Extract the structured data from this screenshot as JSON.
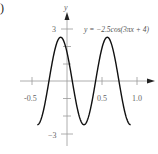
{
  "panel_label": ")",
  "chart_data": {
    "type": "line",
    "title": "",
    "equation": "y = −2.5cos(3πx + 4)",
    "xlabel": "",
    "ylabel": "y",
    "x_ticks": [
      -0.5,
      0.5,
      1.0
    ],
    "x_tick_labels": [
      "-0.5",
      "0.5",
      "1.0"
    ],
    "y_ticks": [
      3,
      -3
    ],
    "y_tick_labels": [
      "3",
      "−3"
    ],
    "xlim": [
      -0.5,
      1.1
    ],
    "ylim": [
      -3.5,
      4
    ],
    "amplitude": 2.5,
    "series": [
      {
        "name": "y = -2.5cos(3πx + 4)",
        "x_range": [
          -0.424,
          0.909
        ],
        "key_points": [
          {
            "x": -0.424,
            "y": -2.5
          },
          {
            "x": -0.091,
            "y": 2.5
          },
          {
            "x": 0.242,
            "y": -2.5
          },
          {
            "x": 0.576,
            "y": 2.5
          },
          {
            "x": 0.909,
            "y": -2.5
          }
        ]
      }
    ],
    "grid": false,
    "legend": "none"
  }
}
